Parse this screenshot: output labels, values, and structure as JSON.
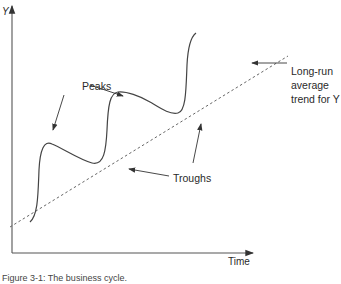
{
  "axes": {
    "y_label": "Y",
    "x_label": "Time"
  },
  "annotations": {
    "peaks": "Peaks",
    "troughs": "Troughs",
    "trend_line1": "Long-run",
    "trend_line2": "average",
    "trend_line3": "trend for Y"
  },
  "caption": "Figure 3-1: The business cycle.",
  "colors": {
    "curve": "#444444",
    "trend": "#666666",
    "axis": "#555555"
  }
}
